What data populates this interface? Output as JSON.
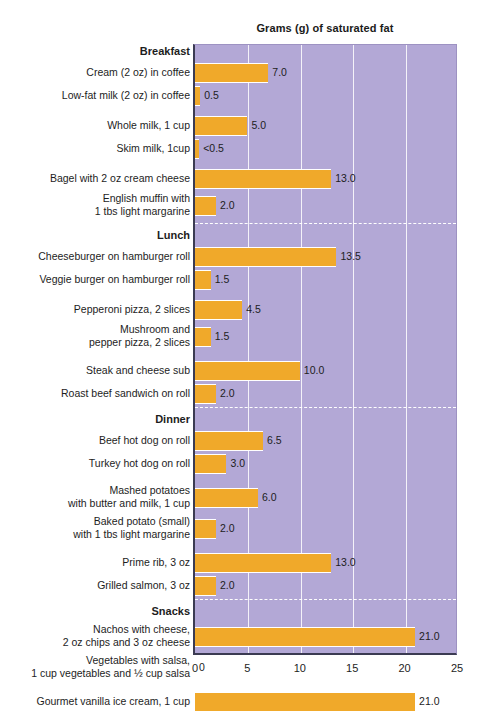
{
  "chart_data": {
    "type": "bar",
    "orientation": "horizontal",
    "title": "Grams (g) of saturated fat",
    "xlabel": "",
    "ylabel": "",
    "xlim": [
      0,
      25
    ],
    "xticks": [
      0,
      5,
      10,
      15,
      20,
      25
    ],
    "xtick_labels": [
      "0",
      "5",
      "10",
      "15",
      "20",
      "25"
    ],
    "grid": true,
    "legend": "none",
    "colors": {
      "bar": "#f0a92a",
      "plot_background": "#b3a8d6",
      "gridline": "#ffffff",
      "axis": "#3b3b52",
      "text": "#1d1d1d",
      "page_background": "#ffffff"
    },
    "sections": [
      {
        "name": "Breakfast",
        "items": [
          {
            "label": "Cream (2 oz) in coffee",
            "value": 7.0,
            "value_label": "7.0"
          },
          {
            "label": "Low-fat milk (2 oz) in coffee",
            "value": 0.5,
            "value_label": "0.5"
          },
          {
            "label": "Whole milk, 1 cup",
            "value": 5.0,
            "value_label": "5.0"
          },
          {
            "label": "Skim milk, 1cup",
            "value": 0.4,
            "value_label": "<0.5"
          },
          {
            "label": "Bagel with 2 oz cream cheese",
            "value": 13.0,
            "value_label": "13.0"
          },
          {
            "label": "English muffin with\n1 tbs light margarine",
            "value": 2.0,
            "value_label": "2.0"
          }
        ]
      },
      {
        "name": "Lunch",
        "items": [
          {
            "label": "Cheeseburger on hamburger roll",
            "value": 13.5,
            "value_label": "13.5"
          },
          {
            "label": "Veggie burger on hamburger roll",
            "value": 1.5,
            "value_label": "1.5"
          },
          {
            "label": "Pepperoni pizza, 2 slices",
            "value": 4.5,
            "value_label": "4.5"
          },
          {
            "label": "Mushroom and\npepper pizza, 2 slices",
            "value": 1.5,
            "value_label": "1.5"
          },
          {
            "label": "Steak and cheese sub",
            "value": 10.0,
            "value_label": "10.0"
          },
          {
            "label": "Roast beef sandwich on roll",
            "value": 2.0,
            "value_label": "2.0"
          }
        ]
      },
      {
        "name": "Dinner",
        "items": [
          {
            "label": "Beef hot dog on roll",
            "value": 6.5,
            "value_label": "6.5"
          },
          {
            "label": "Turkey hot dog on roll",
            "value": 3.0,
            "value_label": "3.0"
          },
          {
            "label": "Mashed potatoes\nwith butter and milk, 1 cup",
            "value": 6.0,
            "value_label": "6.0"
          },
          {
            "label": "Baked potato (small)\nwith 1 tbs light margarine",
            "value": 2.0,
            "value_label": "2.0"
          },
          {
            "label": "Prime rib, 3 oz",
            "value": 13.0,
            "value_label": "13.0"
          },
          {
            "label": "Grilled salmon, 3 oz",
            "value": 2.0,
            "value_label": "2.0"
          }
        ]
      },
      {
        "name": "Snacks",
        "items": [
          {
            "label": "Nachos with cheese,\n2 oz chips and 3 oz cheese",
            "value": 21.0,
            "value_label": "21.0"
          },
          {
            "label": "Vegetables with salsa,\n1 cup vegetables and ½ cup salsa",
            "value": 0,
            "value_label": "0"
          },
          {
            "label": "Gourmet vanilla ice cream, 1 cup",
            "value": 21.0,
            "value_label": "21.0"
          },
          {
            "label": "Gourmet lemon sorbet, 1 cup",
            "value": 0,
            "value_label": "0"
          }
        ]
      }
    ]
  },
  "layout": {
    "plot_left": 193,
    "plot_top": 44,
    "plot_width": 264,
    "plot_height": 611,
    "bar_origin_x": 195,
    "px_per_unit": 10.48
  }
}
